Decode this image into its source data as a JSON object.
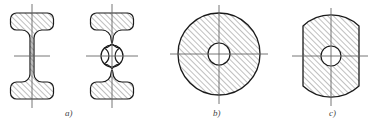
{
  "drawing": {
    "title": "Cross-section views of shaft profiles with hatching",
    "background_color": "#ffffff",
    "outline_color": "#1a1a1a",
    "hatch_color": "#555555",
    "centerline_color": "#666666",
    "hatch_angle_deg": 45,
    "hatch_spacing_px": 4,
    "labels": [
      {
        "id": "label-a",
        "text": "a)",
        "x": 65,
        "y": 108
      },
      {
        "id": "label-b",
        "text": "b)",
        "x": 213,
        "y": 108
      },
      {
        "id": "label-c",
        "text": "c)",
        "x": 329,
        "y": 108
      }
    ],
    "figures": [
      {
        "name": "i-beam-solid",
        "label": "a)",
        "group": "a",
        "description": "Solid I-beam cross-section with rounded flanges and concave fillets",
        "center": {
          "x": 32,
          "y": 56
        },
        "bounds": {
          "x": 8,
          "y": 13,
          "width": 48,
          "height": 86
        },
        "has_hole": false,
        "vertical_centerline": {
          "x": 32,
          "y1": 4,
          "y2": 108
        },
        "horizontal_centerline": {
          "y": 56,
          "x1": 14,
          "x2": 50
        }
      },
      {
        "name": "i-beam-bored",
        "label": "a)",
        "group": "a",
        "description": "I-beam cross-section with central bore hole through the web",
        "center": {
          "x": 112,
          "y": 56
        },
        "bounds": {
          "x": 88,
          "y": 13,
          "width": 48,
          "height": 86
        },
        "has_hole": true,
        "hole_radius": 11,
        "vertical_centerline": {
          "x": 112,
          "y1": 4,
          "y2": 108
        },
        "horizontal_centerline": {
          "y": 56,
          "x1": 86,
          "x2": 138
        }
      },
      {
        "name": "circular-disc-bored",
        "label": "b)",
        "group": "b",
        "description": "Full circular cross-section with central bore hole",
        "center": {
          "x": 219,
          "y": 54
        },
        "radius": 41,
        "has_hole": true,
        "hole_radius": 11,
        "vertical_centerline": {
          "x": 219,
          "y1": 5,
          "y2": 104
        },
        "horizontal_centerline": {
          "y": 54,
          "x1": 170,
          "x2": 268
        }
      },
      {
        "name": "double-flatted-disc-bored",
        "label": "c)",
        "group": "c",
        "description": "Circular cross-section with two parallel flats on left and right, central bore hole",
        "center": {
          "x": 331,
          "y": 56
        },
        "radius": 41,
        "flat_half_width": 28,
        "has_hole": true,
        "hole_radius": 10,
        "vertical_centerline": {
          "x": 331,
          "y1": 8,
          "y2": 106
        },
        "horizontal_centerline": {
          "y": 56,
          "x1": 292,
          "x2": 368
        }
      }
    ]
  }
}
